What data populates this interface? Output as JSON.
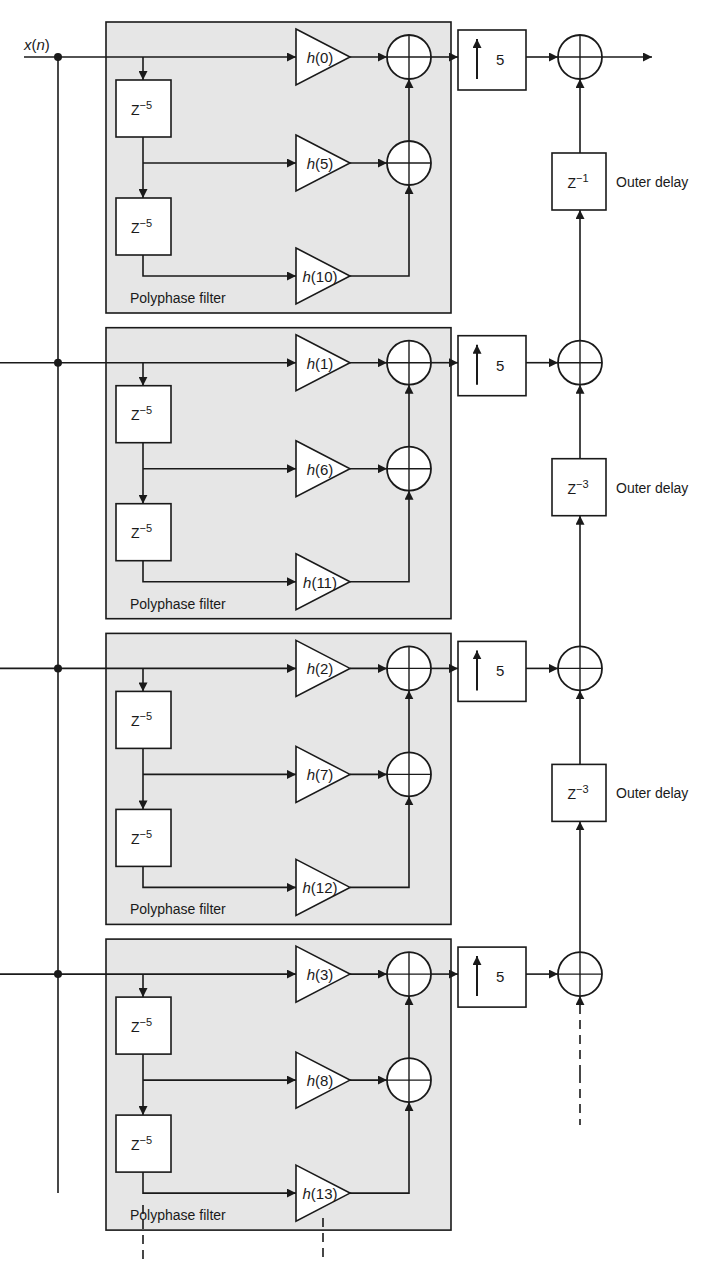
{
  "diagram": {
    "input_label_var": "x",
    "input_label_arg": "n",
    "block_label": "Polyphase filter",
    "inner_delay": {
      "base": "Z",
      "exp": "−5"
    },
    "upsampler_factor": "5",
    "outer_delay_label": "Outer delay",
    "colors": {
      "block_fill": "#e6e6e6",
      "stroke": "#1a1a1a",
      "box_fill": "#ffffff"
    },
    "blocks": [
      {
        "coefficients": [
          "0",
          "5",
          "10"
        ],
        "outer_delay_exp": "−1"
      },
      {
        "coefficients": [
          "1",
          "6",
          "11"
        ],
        "outer_delay_exp": "−3"
      },
      {
        "coefficients": [
          "2",
          "7",
          "12"
        ],
        "outer_delay_exp": "−3"
      },
      {
        "coefficients": [
          "3",
          "8",
          "13"
        ],
        "outer_delay_exp": null
      }
    ],
    "continuation": "dashed lines indicate further polyphase branches"
  }
}
